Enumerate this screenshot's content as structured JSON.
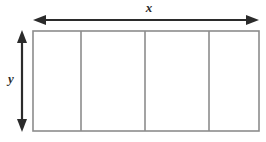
{
  "figure": {
    "type": "geometry-diagram",
    "background_color": "#ffffff"
  },
  "labels": {
    "width_label": "x",
    "height_label": "y"
  },
  "rectangle": {
    "x": 33,
    "y": 31,
    "width": 226,
    "height": 100,
    "stroke_color": "#8c8c8c",
    "stroke_width": 1.6,
    "fill_color": "#ffffff",
    "divider_positions": [
      81,
      145,
      209
    ],
    "section_count": 4
  },
  "dimension_arrows": {
    "horizontal": {
      "name": "width-arrow",
      "x1": 34,
      "x2": 258,
      "y": 20,
      "color": "#2b2b2b",
      "double_headed": true
    },
    "vertical": {
      "name": "height-arrow",
      "x": 22,
      "y1": 31,
      "y2": 131,
      "color": "#2b2b2b",
      "double_headed": true
    }
  }
}
